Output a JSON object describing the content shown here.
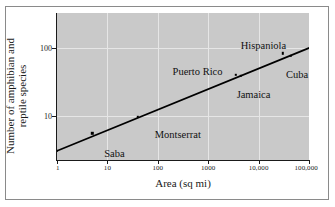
{
  "chart_data": {
    "type": "scatter",
    "title": "",
    "xlabel": "Area  (sq mi)",
    "ylabel": "Number of amphibian and reptile species",
    "xscale": "log",
    "yscale": "log",
    "xlim": [
      1,
      100000
    ],
    "ylim": [
      2.2,
      330
    ],
    "grid": true,
    "legend": "none",
    "x_tick_labels": [
      "1",
      "10",
      "100",
      "1000",
      "10,000",
      "100,000"
    ],
    "x_tick_values": [
      1,
      10,
      100,
      1000,
      10000,
      100000
    ],
    "y_tick_labels": [
      "10",
      "100"
    ],
    "y_tick_values": [
      10,
      100
    ],
    "points": [
      {
        "label": "Redonda",
        "x": 1,
        "y": 3
      },
      {
        "label": "Saba",
        "x": 5,
        "y": 5.5
      },
      {
        "label": "Montserrat",
        "x": 40,
        "y": 9.5
      },
      {
        "label": "Puerto Rico",
        "x": 3500,
        "y": 40
      },
      {
        "label": "Jamaica",
        "x": 4400,
        "y": 39
      },
      {
        "label": "Hispaniola",
        "x": 30000,
        "y": 84
      },
      {
        "label": "Cuba",
        "x": 44000,
        "y": 76
      }
    ],
    "trendline": {
      "description": "log-log regression line",
      "x_start": 1,
      "y_start": 3,
      "x_end": 100000,
      "y_end": 100
    },
    "colors": {
      "panel_background": "#c9c9c9",
      "gridline": "#e6e6e6",
      "axis": "#1a1a1a",
      "marker": "#000000",
      "trendline": "#000000",
      "figure_background": "#ffffff",
      "frame": "#8a8a8a"
    }
  }
}
